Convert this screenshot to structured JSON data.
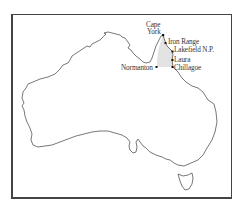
{
  "map": {
    "region": "Australia",
    "highlight_region": "Cape York Peninsula (shaded)",
    "highlight_color": "#e3e3e3",
    "coast_color": "#555555",
    "places": [
      {
        "name": "Cape York",
        "line1": "Cape",
        "line2": "York",
        "x": 163,
        "y": 35
      },
      {
        "name": "Iron Range",
        "label": "Iron Range",
        "x": 166,
        "y": 43
      },
      {
        "name": "Lakefield N.P.",
        "label": "Lakefield N.P.",
        "x": 173,
        "y": 51
      },
      {
        "name": "Laura",
        "label": "Laura",
        "x": 173,
        "y": 60
      },
      {
        "name": "Chillagoe",
        "label": "Chillagoe",
        "x": 173,
        "y": 67
      },
      {
        "name": "Normanton",
        "label": "Normanton",
        "x": 157,
        "y": 67
      }
    ]
  }
}
